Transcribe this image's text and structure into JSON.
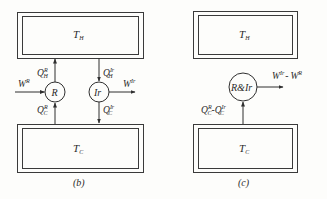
{
  "panels": {
    "b": {
      "caption": "(b)",
      "hot_reservoir": {
        "symbol": "T",
        "sub": "H"
      },
      "cold_reservoir": {
        "symbol": "T",
        "sub": "C"
      },
      "engine_R": {
        "label": "R"
      },
      "engine_Ir": {
        "label": "Ir"
      },
      "flows": {
        "QHR": {
          "base": "Q",
          "sup": "R",
          "sub": "H"
        },
        "QCR": {
          "base": "Q",
          "sup": "R",
          "sub": "C"
        },
        "QHIr": {
          "base": "Q",
          "sup": "Ir",
          "sub": "H"
        },
        "QCIr": {
          "base": "Q",
          "sup": "Ir",
          "sub": "C"
        },
        "WR": {
          "base": "W",
          "sup": "R"
        },
        "WIr": {
          "base": "W",
          "sup": "Ir"
        }
      }
    },
    "c": {
      "caption": "(c)",
      "hot_reservoir": {
        "symbol": "T",
        "sub": "H"
      },
      "cold_reservoir": {
        "symbol": "T",
        "sub": "C"
      },
      "combined_engine": {
        "label": "R&Ir"
      },
      "flows": {
        "Qdiff": {
          "a_base": "Q",
          "a_sup": "R",
          "a_sub": "C",
          "op": "-",
          "b_base": "Q",
          "b_sup": "Ir",
          "b_sub": "C"
        },
        "Wdiff": {
          "a_base": "W",
          "a_sup": "Ir",
          "op": "-",
          "b_base": "W",
          "b_sup": "R"
        }
      }
    }
  },
  "colors": {
    "ink": "#2f2f2f",
    "background": "#fdfdfb"
  }
}
